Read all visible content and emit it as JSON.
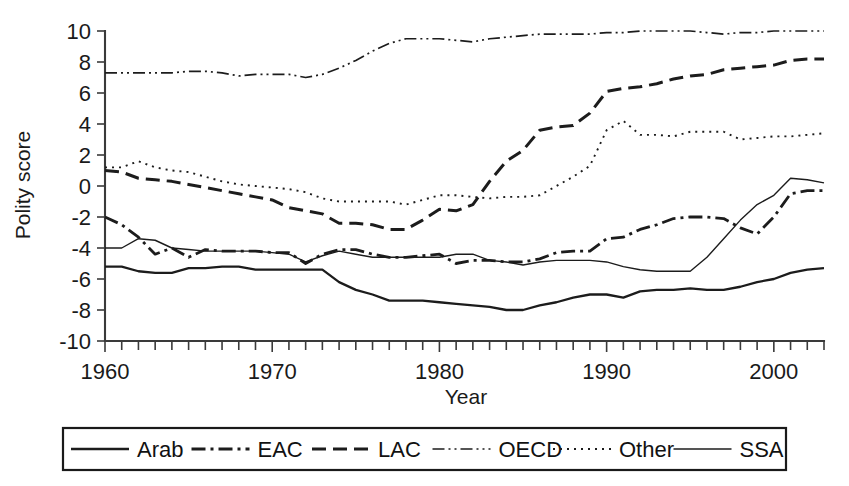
{
  "chart_data": {
    "type": "line",
    "title": "",
    "xlabel": "Year",
    "ylabel": "Polity score",
    "xlim": [
      1960,
      2003
    ],
    "ylim": [
      -10,
      10
    ],
    "grid": false,
    "legend_position": "bottom",
    "xticks": [
      1960,
      1970,
      1980,
      1990,
      2000
    ],
    "xtick_labels": [
      "1960",
      "1970",
      "1980",
      "1990",
      "2000"
    ],
    "yticks": [
      -10,
      -8,
      -6,
      -4,
      -2,
      0,
      2,
      4,
      6,
      8,
      10
    ],
    "ytick_labels": [
      "-10",
      "-8",
      "-6",
      "-4",
      "-2",
      "0",
      "2",
      "4",
      "6",
      "8",
      "10"
    ],
    "x": [
      1960,
      1961,
      1962,
      1963,
      1964,
      1965,
      1966,
      1967,
      1968,
      1969,
      1970,
      1971,
      1972,
      1973,
      1974,
      1975,
      1976,
      1977,
      1978,
      1979,
      1980,
      1981,
      1982,
      1983,
      1984,
      1985,
      1986,
      1987,
      1988,
      1989,
      1990,
      1991,
      1992,
      1993,
      1994,
      1995,
      1996,
      1997,
      1998,
      1999,
      2000,
      2001,
      2002,
      2003
    ],
    "series": [
      {
        "name": "Arab",
        "style": "solid",
        "width": 2.3,
        "dash": "none",
        "values": [
          -5.2,
          -5.2,
          -5.5,
          -5.6,
          -5.6,
          -5.3,
          -5.3,
          -5.2,
          -5.2,
          -5.4,
          -5.4,
          -5.4,
          -5.4,
          -5.4,
          -6.2,
          -6.7,
          -7.0,
          -7.4,
          -7.4,
          -7.4,
          -7.5,
          -7.6,
          -7.7,
          -7.8,
          -8.0,
          -8.0,
          -7.7,
          -7.5,
          -7.2,
          -7.0,
          -7.0,
          -7.2,
          -6.8,
          -6.7,
          -6.7,
          -6.6,
          -6.7,
          -6.7,
          -6.5,
          -6.2,
          -6.0,
          -5.6,
          -5.4,
          -5.3
        ]
      },
      {
        "name": "EAC",
        "style": "dash-dot",
        "width": 2.8,
        "dash": "14,5,3,5",
        "values": [
          -2.0,
          -2.5,
          -3.3,
          -4.4,
          -4.0,
          -4.6,
          -4.1,
          -4.2,
          -4.2,
          -4.2,
          -4.3,
          -4.3,
          -5.0,
          -4.4,
          -4.1,
          -4.1,
          -4.4,
          -4.6,
          -4.6,
          -4.5,
          -4.4,
          -5.0,
          -4.8,
          -4.8,
          -4.9,
          -4.9,
          -4.7,
          -4.3,
          -4.2,
          -4.2,
          -3.4,
          -3.3,
          -2.8,
          -2.5,
          -2.1,
          -2.0,
          -2.0,
          -2.1,
          -2.7,
          -3.1,
          -2.0,
          -0.5,
          -0.3,
          -0.3
        ]
      },
      {
        "name": "LAC",
        "style": "dashed",
        "width": 3.0,
        "dash": "14,7",
        "values": [
          1.0,
          0.9,
          0.5,
          0.4,
          0.3,
          0.1,
          -0.1,
          -0.3,
          -0.5,
          -0.7,
          -0.9,
          -1.4,
          -1.6,
          -1.8,
          -2.4,
          -2.4,
          -2.5,
          -2.8,
          -2.8,
          -2.2,
          -1.5,
          -1.6,
          -1.2,
          0.3,
          1.6,
          2.3,
          3.6,
          3.8,
          3.9,
          4.7,
          6.1,
          6.3,
          6.4,
          6.6,
          6.9,
          7.1,
          7.2,
          7.5,
          7.6,
          7.7,
          7.8,
          8.1,
          8.2,
          8.2
        ]
      },
      {
        "name": "OECD",
        "style": "dash-dot-dot",
        "width": 1.7,
        "dash": "12,4,2,4,2,4",
        "values": [
          7.3,
          7.3,
          7.3,
          7.3,
          7.3,
          7.4,
          7.4,
          7.3,
          7.1,
          7.2,
          7.2,
          7.2,
          7.0,
          7.2,
          7.6,
          8.1,
          8.7,
          9.2,
          9.5,
          9.5,
          9.5,
          9.4,
          9.3,
          9.5,
          9.6,
          9.7,
          9.8,
          9.8,
          9.8,
          9.8,
          9.9,
          9.9,
          10.0,
          10.0,
          10.0,
          10.0,
          9.9,
          9.8,
          9.9,
          9.9,
          10.0,
          10.0,
          10.0,
          10.0
        ]
      },
      {
        "name": "Other",
        "style": "dotted",
        "width": 1.9,
        "dash": "2,5",
        "values": [
          1.2,
          1.2,
          1.6,
          1.2,
          1.0,
          0.9,
          0.6,
          0.3,
          0.1,
          0.0,
          -0.1,
          -0.2,
          -0.4,
          -0.8,
          -1.0,
          -1.0,
          -1.0,
          -1.0,
          -1.2,
          -0.9,
          -0.6,
          -0.6,
          -0.7,
          -0.8,
          -0.7,
          -0.7,
          -0.6,
          0.0,
          0.6,
          1.3,
          3.6,
          4.2,
          3.3,
          3.3,
          3.2,
          3.5,
          3.5,
          3.5,
          3.0,
          3.1,
          3.2,
          3.2,
          3.3,
          3.4
        ]
      },
      {
        "name": "SSA",
        "style": "solid-thin",
        "width": 1.4,
        "dash": "none",
        "values": [
          -4.0,
          -4.0,
          -3.4,
          -3.5,
          -4.0,
          -4.1,
          -4.2,
          -4.2,
          -4.2,
          -4.2,
          -4.3,
          -4.4,
          -4.9,
          -4.5,
          -4.2,
          -4.4,
          -4.6,
          -4.6,
          -4.6,
          -4.6,
          -4.6,
          -4.4,
          -4.4,
          -4.8,
          -4.9,
          -5.1,
          -4.9,
          -4.8,
          -4.8,
          -4.8,
          -4.9,
          -5.2,
          -5.4,
          -5.5,
          -5.5,
          -5.5,
          -4.6,
          -3.4,
          -2.2,
          -1.2,
          -0.6,
          0.5,
          0.4,
          0.2
        ]
      }
    ]
  },
  "legend": {
    "entries": [
      {
        "label": "Arab",
        "style": "solid"
      },
      {
        "label": "EAC",
        "style": "dash-dot"
      },
      {
        "label": "LAC",
        "style": "dashed"
      },
      {
        "label": "OECD",
        "style": "dash-dot-dot"
      },
      {
        "label": "Other",
        "style": "dotted"
      },
      {
        "label": "SSA",
        "style": "solid-thin"
      }
    ]
  }
}
